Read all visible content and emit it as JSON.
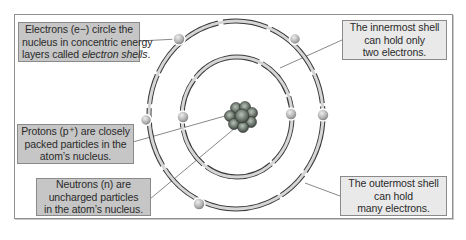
{
  "diagram": {
    "labels": {
      "electrons": {
        "lines": [
          "Electrons (e−) circle the",
          "nucleus in concentric energy",
          "layers called "
        ],
        "italic_term": "electron shells",
        "suffix": "."
      },
      "innermost": {
        "lines": [
          "The innermost shell",
          "can hold only",
          "two electrons."
        ]
      },
      "protons": {
        "lines": [
          "Protons (p⁺) are closely",
          "packed particles in the",
          "atom’s nucleus."
        ]
      },
      "neutrons": {
        "lines": [
          "Neutrons (n) are",
          "uncharged particles",
          "in the atom’s nucleus."
        ]
      },
      "outermost": {
        "lines": [
          "The outermost shell",
          "can hold",
          "many electrons."
        ]
      }
    },
    "colors": {
      "dark_box": "#c6c6c6",
      "light_box": "#e9e9e9",
      "shell": "#d4d4d4",
      "shell_outline": "#3a3a3a",
      "nucleus": "#6f7f72",
      "electron": "#b8b8b8"
    },
    "shells": [
      {
        "name": "inner",
        "electron_count": 2
      },
      {
        "name": "outer",
        "electron_count": 5
      }
    ]
  }
}
